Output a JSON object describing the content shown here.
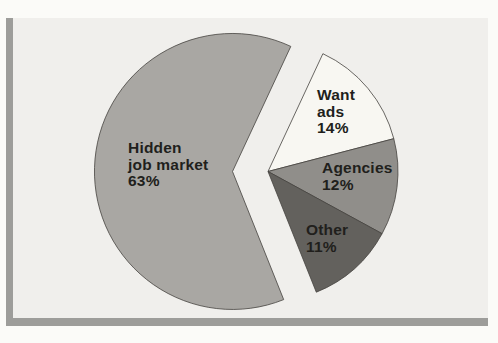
{
  "chart_data": {
    "type": "pie",
    "title": "",
    "unit": "%",
    "legend": "none",
    "labels_position": "inside",
    "exploded": true,
    "slices": [
      {
        "label": "Hidden job market",
        "value": 63,
        "color": "#a9a7a3",
        "label_lines": [
          "Hidden",
          "job market",
          "63%"
        ]
      },
      {
        "label": "Want ads",
        "value": 14,
        "color": "#f8f7f2",
        "label_lines": [
          "Want",
          "ads",
          "14%"
        ]
      },
      {
        "label": "Agencies",
        "value": 12,
        "color": "#908e8a",
        "label_lines": [
          "Agencies",
          "12%"
        ]
      },
      {
        "label": "Other",
        "value": 11,
        "color": "#63615d",
        "label_lines": [
          "Other",
          "11%"
        ]
      }
    ],
    "colors": {
      "panel_background": "#f0efec",
      "page_background": "#fbfbf8",
      "shadow_frame": "#9d9d9a",
      "slice_outline": "#45433f",
      "label_text": "#211f1c"
    }
  }
}
